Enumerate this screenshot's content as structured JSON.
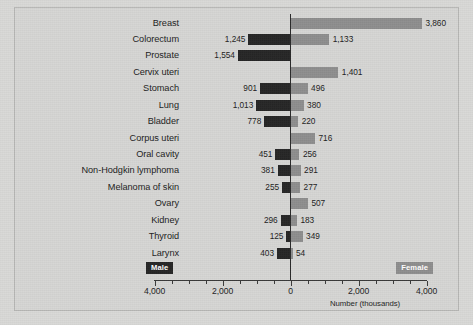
{
  "chart_data": {
    "type": "bar",
    "title": "",
    "subtitle": "",
    "xlabel": "Number (thousands)",
    "ylabel": "",
    "orientation": "horizontal-diverging",
    "xlim": [
      -5000,
      5000
    ],
    "grid": false,
    "legend_position": "bottom-left-and-bottom-right",
    "axis_ticks": [
      {
        "label": "4,000",
        "value": -4000
      },
      {
        "label": "2,000",
        "value": -2000
      },
      {
        "label": "0",
        "value": 0
      },
      {
        "label": "2,000",
        "value": 2000
      },
      {
        "label": "4,000",
        "value": 4000
      }
    ],
    "minor_tick_interval": 500,
    "categories": [
      "Breast",
      "Colorectum",
      "Prostate",
      "Cervix uteri",
      "Stomach",
      "Lung",
      "Bladder",
      "Corpus uteri",
      "Oral cavity",
      "Non-Hodgkin lymphoma",
      "Melanoma of skin",
      "Ovary",
      "Kidney",
      "Thyroid",
      "Larynx"
    ],
    "series": [
      {
        "name": "Male",
        "color": "#262626",
        "direction": "left",
        "values": [
          null,
          1245,
          1554,
          null,
          901,
          1013,
          778,
          null,
          451,
          381,
          255,
          null,
          296,
          125,
          403
        ],
        "labels": [
          "",
          "1,245",
          "1,554",
          "",
          "901",
          "1,013",
          "778",
          "",
          "451",
          "381",
          "255",
          "",
          "296",
          "125",
          "403"
        ]
      },
      {
        "name": "Female",
        "color": "#8e8e8e",
        "direction": "right",
        "values": [
          3860,
          1133,
          null,
          1401,
          496,
          380,
          220,
          716,
          256,
          291,
          277,
          507,
          183,
          349,
          54
        ],
        "labels": [
          "3,860",
          "1,133",
          "",
          "1,401",
          "496",
          "380",
          "220",
          "716",
          "256",
          "291",
          "277",
          "507",
          "183",
          "349",
          "54"
        ]
      }
    ]
  },
  "legend": {
    "male_label": "Male",
    "female_label": "Female"
  }
}
